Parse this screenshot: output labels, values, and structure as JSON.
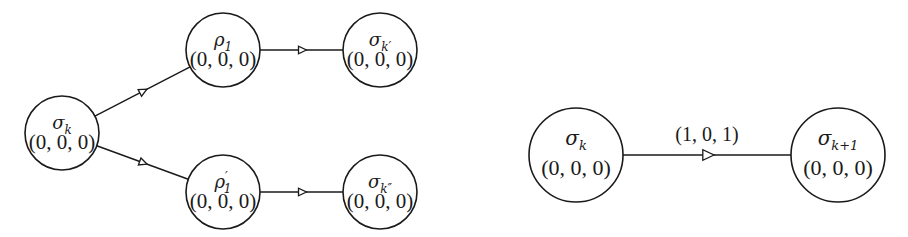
{
  "diagrams": [
    {
      "id": "branching",
      "nodes": [
        {
          "id": "sigma_k",
          "symbol": "σ",
          "subscript": "k",
          "superscript": "",
          "vector": "(0, 0, 0)"
        },
        {
          "id": "rho_1",
          "symbol": "ρ",
          "subscript": "1",
          "superscript": "",
          "vector": "(0, 0, 0)"
        },
        {
          "id": "rho_1p",
          "symbol": "ρ",
          "subscript": "1",
          "superscript": "′",
          "vector": "(0, 0, 0)"
        },
        {
          "id": "sigma_kp",
          "symbol": "σ",
          "subscript": "k′",
          "superscript": "",
          "vector": "(0, 0, 0)"
        },
        {
          "id": "sigma_kpp",
          "symbol": "σ",
          "subscript": "k″",
          "superscript": "",
          "vector": "(0, 0, 0)"
        }
      ],
      "edges": [
        {
          "from": "sigma_k",
          "to": "rho_1",
          "label": ""
        },
        {
          "from": "sigma_k",
          "to": "rho_1p",
          "label": ""
        },
        {
          "from": "rho_1",
          "to": "sigma_kp",
          "label": ""
        },
        {
          "from": "rho_1p",
          "to": "sigma_kpp",
          "label": ""
        }
      ]
    },
    {
      "id": "transition",
      "nodes": [
        {
          "id": "sigma_k2",
          "symbol": "σ",
          "subscript": "k",
          "superscript": "",
          "vector": "(0, 0, 0)"
        },
        {
          "id": "sigma_k1",
          "symbol": "σ",
          "subscript": "k+1",
          "superscript": "",
          "vector": "(0, 0, 0)"
        }
      ],
      "edges": [
        {
          "from": "sigma_k2",
          "to": "sigma_k1",
          "label": "(1, 0, 1)"
        }
      ]
    }
  ],
  "colors": {
    "stroke": "#1a1a1a",
    "background": "#ffffff"
  }
}
